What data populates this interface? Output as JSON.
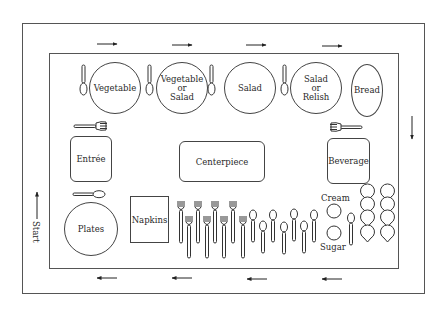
{
  "diagram": {
    "type": "buffet-table-layout",
    "start_label": "Start",
    "stations": {
      "vegetable": "Vegetable",
      "vegetable_or_salad": [
        "Vegetable",
        "or",
        "Salad"
      ],
      "salad": "Salad",
      "salad_or_relish": [
        "Salad",
        "or",
        "Relish"
      ],
      "bread": "Bread",
      "entree": "Entrée",
      "centerpiece": "Centerpiece",
      "beverage": "Beverage",
      "plates": "Plates",
      "napkins": "Napkins",
      "cream": "Cream",
      "sugar": "Sugar"
    },
    "flow_arrows": {
      "top": [
        "right",
        "right",
        "right",
        "right"
      ],
      "right": [
        "down"
      ],
      "bottom": [
        "left",
        "left",
        "left",
        "left"
      ],
      "left": [
        "up"
      ]
    },
    "utensils": {
      "forks_count": 8,
      "spoons_count": 8,
      "cups_count": 8
    },
    "colors": {
      "line": "#444444",
      "background": "#ffffff"
    }
  }
}
